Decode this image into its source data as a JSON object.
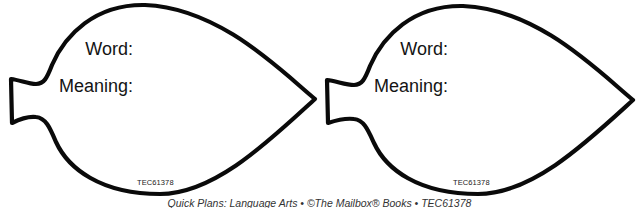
{
  "cards": [
    {
      "word_label": "Word:",
      "meaning_label": "Meaning:",
      "code": "TEC61378"
    },
    {
      "word_label": "Word:",
      "meaning_label": "Meaning:",
      "code": "TEC61378"
    }
  ],
  "footer": {
    "text": "Quick Plans: Language Arts • ©The Mailbox® Books • TEC61378"
  },
  "colors": {
    "outline": "#0a0a0a",
    "background": "#ffffff",
    "text": "#141414"
  }
}
